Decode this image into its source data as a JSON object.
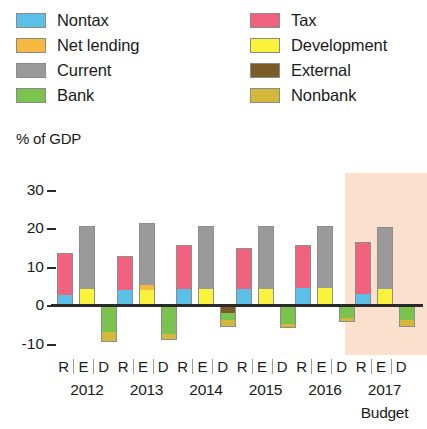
{
  "legend": {
    "left_column": [
      {
        "label": "Nontax",
        "key": "nontax",
        "color": "#5bc0e8"
      },
      {
        "label": "Net lending",
        "key": "net_lending",
        "color": "#f5b942"
      },
      {
        "label": "Current",
        "key": "current",
        "color": "#9a9a9a"
      },
      {
        "label": "Bank",
        "key": "bank",
        "color": "#7cc24f"
      }
    ],
    "right_column": [
      {
        "label": "Tax",
        "key": "tax",
        "color": "#f0627e"
      },
      {
        "label": "Development",
        "key": "development",
        "color": "#fbf23c"
      },
      {
        "label": "External",
        "key": "external",
        "color": "#7a5c28"
      },
      {
        "label": "Nonbank",
        "key": "nonbank",
        "color": "#d4b83c"
      }
    ]
  },
  "axis_title": "% of GDP",
  "highlight_color": "#fae0cd",
  "chart_data": {
    "type": "bar",
    "title": "",
    "subtitle": "",
    "xlabel": "",
    "ylabel": "% of GDP",
    "ylim": [
      -13,
      32
    ],
    "yticks": [
      30,
      20,
      10,
      0,
      -10
    ],
    "ytick_labels": [
      "30",
      "20",
      "10",
      "0",
      "-10"
    ],
    "grid": false,
    "legend_position": "top",
    "stacked": true,
    "bar_group_labels": [
      "R",
      "E",
      "D"
    ],
    "categories": [
      "2012",
      "2013",
      "2014",
      "2015",
      "2016",
      "2017"
    ],
    "category_notes": {
      "2017": "Budget"
    },
    "highlighted_category": "2017",
    "series": [
      {
        "name": "Nontax",
        "bar": "R",
        "color": "#5bc0e8",
        "values": [
          2.5,
          3.8,
          4.2,
          4.2,
          4.5,
          2.8
        ]
      },
      {
        "name": "Tax",
        "bar": "R",
        "color": "#f0627e",
        "values": [
          11.0,
          9.0,
          11.5,
          10.5,
          11.0,
          13.5
        ]
      },
      {
        "name": "Development",
        "bar": "E",
        "color": "#fbf23c",
        "values": [
          4.2,
          4.0,
          4.2,
          4.2,
          4.5,
          4.2
        ]
      },
      {
        "name": "Net lending",
        "bar": "E",
        "color": "#f5b942",
        "values": [
          0.0,
          1.3,
          0.0,
          0.0,
          0.0,
          0.0
        ]
      },
      {
        "name": "Current",
        "bar": "E",
        "color": "#9a9a9a",
        "values": [
          16.3,
          16.0,
          16.3,
          16.3,
          16.0,
          16.0
        ]
      },
      {
        "name": "External",
        "bar": "D",
        "color": "#7a5c28",
        "values": [
          0.0,
          0.0,
          -2.0,
          0.0,
          0.0,
          0.0
        ]
      },
      {
        "name": "Bank",
        "bar": "D",
        "color": "#7cc24f",
        "values": [
          -7.0,
          -7.5,
          -1.8,
          -5.0,
          -3.5,
          -4.0
        ]
      },
      {
        "name": "Nonbank",
        "bar": "D",
        "color": "#d4b83c",
        "values": [
          -2.5,
          -1.5,
          -2.0,
          -1.0,
          -1.0,
          -1.8
        ]
      }
    ]
  }
}
